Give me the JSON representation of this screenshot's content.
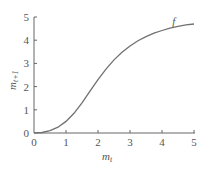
{
  "chart_data": {
    "type": "line",
    "title": "",
    "xlabel": "m_t",
    "ylabel": "m_{t+1}",
    "xlim": [
      0,
      5
    ],
    "ylim": [
      0,
      5
    ],
    "xticks": [
      "0",
      "1",
      "2",
      "3",
      "4",
      "5"
    ],
    "yticks": [
      "0",
      "1",
      "2",
      "3",
      "4",
      "5"
    ],
    "grid": false,
    "series": [
      {
        "name": "f",
        "x": [
          0,
          0.25,
          0.5,
          0.75,
          1.0,
          1.25,
          1.5,
          1.75,
          2.0,
          2.25,
          2.5,
          2.75,
          3.0,
          3.25,
          3.5,
          3.75,
          4.0,
          4.25,
          4.5,
          4.75,
          5.0
        ],
        "y": [
          0,
          0.02,
          0.1,
          0.25,
          0.5,
          0.85,
          1.3,
          1.8,
          2.3,
          2.75,
          3.15,
          3.48,
          3.75,
          3.98,
          4.15,
          4.3,
          4.42,
          4.52,
          4.6,
          4.66,
          4.7
        ]
      }
    ],
    "annotations": [
      {
        "text": "f",
        "x": 4.3,
        "y": 4.5
      }
    ]
  },
  "labels": {
    "x_axis": "m",
    "x_sub": "t",
    "y_axis": "m",
    "y_sub": "t+1",
    "curve": "f"
  }
}
